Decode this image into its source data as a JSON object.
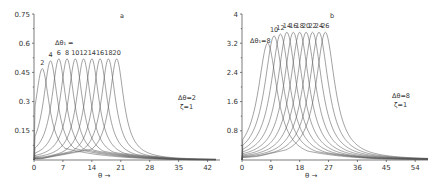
{
  "chart_data": [
    {
      "type": "line",
      "panel_label": "a",
      "title": "",
      "xlabel": "θ →",
      "ylabel": "",
      "xlim": [
        0,
        45
      ],
      "ylim": [
        0,
        0.75
      ],
      "x_ticks": [
        0,
        7,
        14,
        21,
        28,
        35,
        42
      ],
      "y_ticks": [
        0.15,
        0.3,
        0.45,
        0.6,
        0.75
      ],
      "y_tick_labels": [
        "0.15",
        "0.3",
        "0.45",
        "0.6",
        "0.75"
      ],
      "grid": false,
      "legend_title": "Δθ₁ =",
      "annotation": [
        "Δθ=2",
        "ζ=1"
      ],
      "series": [
        {
          "name": "2",
          "peak_x": 2,
          "peak_y": 0.47
        },
        {
          "name": "4",
          "peak_x": 4,
          "peak_y": 0.51
        },
        {
          "name": "6",
          "peak_x": 6,
          "peak_y": 0.52
        },
        {
          "name": "8",
          "peak_x": 8,
          "peak_y": 0.52
        },
        {
          "name": "10",
          "peak_x": 10,
          "peak_y": 0.52
        },
        {
          "name": "12",
          "peak_x": 12,
          "peak_y": 0.52
        },
        {
          "name": "14",
          "peak_x": 14,
          "peak_y": 0.52
        },
        {
          "name": "16",
          "peak_x": 16,
          "peak_y": 0.52
        },
        {
          "name": "18",
          "peak_x": 18,
          "peak_y": 0.52
        },
        {
          "name": "20",
          "peak_x": 20,
          "peak_y": 0.52
        }
      ]
    },
    {
      "type": "line",
      "panel_label": "b",
      "title": "",
      "xlabel": "θ →",
      "ylabel": "",
      "xlim": [
        0,
        58
      ],
      "ylim": [
        0,
        4
      ],
      "x_ticks": [
        0,
        9,
        18,
        27,
        36,
        45,
        54
      ],
      "y_ticks": [
        0.8,
        1.6,
        2.4,
        3.2,
        4
      ],
      "y_tick_labels": [
        "0.8",
        "1.6",
        "2.4",
        "3.2",
        "4"
      ],
      "grid": false,
      "legend_title": "Δθ₁ =",
      "annotation": [
        "Δθ=8",
        "ζ=1"
      ],
      "series": [
        {
          "name": "8",
          "peak_x": 8,
          "peak_y": 3.2
        },
        {
          "name": "10",
          "peak_x": 10,
          "peak_y": 3.4
        },
        {
          "name": "12",
          "peak_x": 12,
          "peak_y": 3.45
        },
        {
          "name": "14",
          "peak_x": 14,
          "peak_y": 3.5
        },
        {
          "name": "16",
          "peak_x": 16,
          "peak_y": 3.5
        },
        {
          "name": "18",
          "peak_x": 18,
          "peak_y": 3.5
        },
        {
          "name": "20",
          "peak_x": 20,
          "peak_y": 3.5
        },
        {
          "name": "22",
          "peak_x": 22,
          "peak_y": 3.5
        },
        {
          "name": "24",
          "peak_x": 24,
          "peak_y": 3.5
        },
        {
          "name": "26",
          "peak_x": 26,
          "peak_y": 3.5
        }
      ]
    }
  ],
  "panels": {
    "a": {
      "label": "a",
      "xlabel": "θ →",
      "legend_title": "Δθ₁ =",
      "peak_labels": [
        "2",
        "4",
        "6",
        "8",
        "10",
        "12",
        "14",
        "16",
        "18",
        "20"
      ],
      "annotation_line1": "Δθ=2",
      "annotation_line2": "ζ=1",
      "x_tick_labels": [
        "0",
        "7",
        "14",
        "21",
        "28",
        "35",
        "42"
      ],
      "y_tick_labels": [
        "0.15",
        "0.3",
        "0.45",
        "0.6",
        "0.75"
      ]
    },
    "b": {
      "label": "b",
      "xlabel": "θ →",
      "legend_prefix": "Δθ₁=8",
      "peak_labels": [
        "10",
        "12",
        "14",
        "16",
        "18",
        "20",
        "22",
        "24",
        "26"
      ],
      "annotation_line1": "Δθ=8",
      "annotation_line2": "ζ=1",
      "x_tick_labels": [
        "0",
        "9",
        "18",
        "27",
        "36",
        "45",
        "54"
      ],
      "y_tick_labels": [
        "0.8",
        "1.6",
        "2.4",
        "3.2",
        "4"
      ]
    }
  }
}
